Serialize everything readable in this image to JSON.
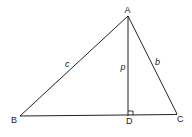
{
  "diagram": {
    "type": "triangle-with-altitude",
    "vertices": {
      "A": {
        "label": "A",
        "x": 128,
        "y": 16
      },
      "B": {
        "label": "B",
        "x": 20,
        "y": 116
      },
      "C": {
        "label": "C",
        "x": 177,
        "y": 114
      },
      "D": {
        "label": "D",
        "x": 128,
        "y": 116
      }
    },
    "sides": {
      "c": {
        "label": "c",
        "from": "A",
        "to": "B"
      },
      "b": {
        "label": "b",
        "from": "A",
        "to": "C"
      },
      "p": {
        "label": "p",
        "from": "A",
        "to": "D"
      }
    },
    "right_angle_at": "D",
    "stroke_color": "#222222"
  }
}
